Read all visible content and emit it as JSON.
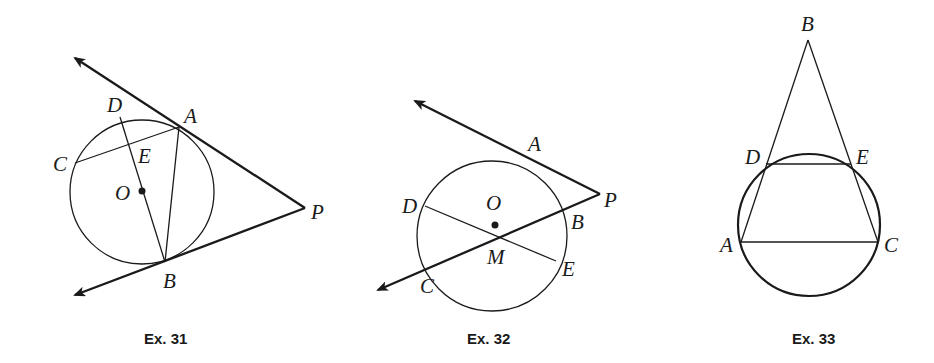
{
  "figures": [
    {
      "caption": "Ex. 31",
      "labels": {
        "A": "A",
        "B": "B",
        "C": "C",
        "D": "D",
        "E": "E",
        "O": "O",
        "P": "P"
      },
      "description": "Circle O with tangent lines PA and PB from external point P; chords CA, AB and diameter DB intersect at E"
    },
    {
      "caption": "Ex. 32",
      "labels": {
        "A": "A",
        "B": "B",
        "C": "C",
        "D": "D",
        "E": "E",
        "O": "O",
        "M": "M",
        "P": "P"
      },
      "description": "Circle O with tangent PA and secant PBC from external point P; chord DE intersects secant at M"
    },
    {
      "caption": "Ex. 33",
      "labels": {
        "A": "A",
        "B": "B",
        "C": "C",
        "D": "D",
        "E": "E"
      },
      "description": "Triangle ABC with A and C on a circle; circle intersects BA at D and BC at E; chord DE drawn"
    }
  ],
  "colors": {
    "ink": "#1a1a1a",
    "background": "#ffffff"
  }
}
